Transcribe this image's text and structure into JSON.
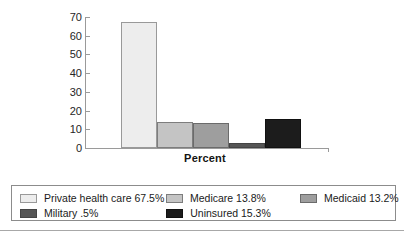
{
  "chart_data": {
    "type": "bar",
    "title": "",
    "xlabel": "Percent",
    "ylabel": "",
    "categories": [
      "Private health care",
      "Medicare",
      "Medicaid",
      "Military",
      "Uninsured"
    ],
    "values": [
      67.5,
      13.8,
      13.2,
      2.5,
      15.3
    ],
    "ylim": [
      0,
      70
    ],
    "yticks": [
      0,
      10,
      20,
      30,
      40,
      50,
      60,
      70
    ],
    "ytick_labels": [
      "0",
      "10",
      "20",
      "30",
      "40",
      "50",
      "60",
      "70"
    ],
    "grid": false,
    "legend_position": "bottom",
    "series": [
      {
        "name": "Private health care",
        "label": "Private health care 67.5%",
        "value": 67.5,
        "color": "#ededed",
        "edge_color": "#999999"
      },
      {
        "name": "Medicare",
        "label": "Medicare 13.8%",
        "value": 13.8,
        "color": "#c4c4c4",
        "edge_color": "#7d7d7d"
      },
      {
        "name": "Medicaid",
        "label": "Medicaid 13.2%",
        "value": 13.2,
        "color": "#9e9e9e",
        "edge_color": "#6b6b6b"
      },
      {
        "name": "Military",
        "label": "Military .5%",
        "value": 2.5,
        "display_value": ".5",
        "color": "#555555",
        "edge_color": "#444444"
      },
      {
        "name": "Uninsured",
        "label": "Uninsured 15.3%",
        "value": 15.3,
        "color": "#1c1c1c",
        "edge_color": "#111111"
      }
    ]
  },
  "axis": {
    "x_title": "Percent",
    "ticks": [
      "70",
      "60",
      "50",
      "40",
      "30",
      "20",
      "10",
      "0"
    ]
  },
  "legend": {
    "rows": [
      [
        {
          "label": "Private health care 67.5%",
          "color": "#ededed",
          "edge": "#999999"
        },
        {
          "label": "Medicare 13.8%",
          "color": "#c4c4c4",
          "edge": "#7d7d7d"
        },
        {
          "label": "Medicaid 13.2%",
          "color": "#9e9e9e",
          "edge": "#6b6b6b"
        }
      ],
      [
        {
          "label": "Military .5%",
          "color": "#555555",
          "edge": "#444444"
        },
        {
          "label": "Uninsured 15.3%",
          "color": "#1c1c1c",
          "edge": "#111111"
        }
      ]
    ]
  }
}
